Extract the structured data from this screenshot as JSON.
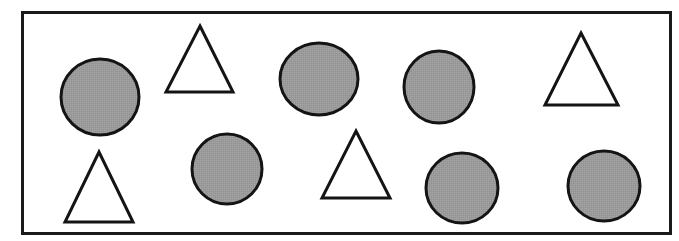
{
  "figure": {
    "canvas": {
      "width": 679,
      "height": 241
    },
    "background_color": "#ffffff",
    "frame": {
      "x": 21,
      "y": 11,
      "width": 651,
      "height": 224,
      "stroke_color": "#1a1a1a",
      "stroke_width": 3,
      "fill_color": "#ffffff"
    },
    "style": {
      "circle_fill": "#9a9a9a",
      "circle_stroke": "#141414",
      "circle_stroke_width": 3,
      "triangle_fill": "#ffffff",
      "triangle_stroke": "#141414",
      "triangle_stroke_width": 3
    },
    "counts": {
      "circles": 6,
      "triangles": 4,
      "total_shapes": 10,
      "rows": 2,
      "shapes_per_row": 5
    },
    "shapes": [
      {
        "id": "circle-1",
        "type": "circle",
        "row": 1,
        "column": 1,
        "fill": "gray",
        "cx": 100,
        "cy": 97,
        "rx": 39,
        "ry": 38
      },
      {
        "id": "triangle-1",
        "type": "triangle",
        "row": 1,
        "column": 2,
        "fill": "white",
        "apex_x": 200,
        "apex_y": 26,
        "base_left_x": 166,
        "base_right_x": 233,
        "base_y": 92
      },
      {
        "id": "circle-2",
        "type": "circle",
        "row": 1,
        "column": 3,
        "fill": "gray",
        "cx": 319,
        "cy": 79,
        "rx": 39,
        "ry": 36
      },
      {
        "id": "circle-3",
        "type": "circle",
        "row": 1,
        "column": 4,
        "fill": "gray",
        "cx": 439,
        "cy": 87,
        "rx": 35,
        "ry": 36
      },
      {
        "id": "triangle-2",
        "type": "triangle",
        "row": 1,
        "column": 5,
        "fill": "white",
        "apex_x": 581,
        "apex_y": 33,
        "base_left_x": 545,
        "base_right_x": 618,
        "base_y": 105
      },
      {
        "id": "triangle-3",
        "type": "triangle",
        "row": 2,
        "column": 1,
        "fill": "white",
        "apex_x": 99,
        "apex_y": 152,
        "base_left_x": 65,
        "base_right_x": 133,
        "base_y": 222
      },
      {
        "id": "circle-4",
        "type": "circle",
        "row": 2,
        "column": 2,
        "fill": "gray",
        "cx": 227,
        "cy": 169,
        "rx": 35,
        "ry": 35
      },
      {
        "id": "triangle-4",
        "type": "triangle",
        "row": 2,
        "column": 3,
        "fill": "white",
        "apex_x": 356,
        "apex_y": 131,
        "base_left_x": 322,
        "base_right_x": 390,
        "base_y": 198
      },
      {
        "id": "circle-5",
        "type": "circle",
        "row": 2,
        "column": 4,
        "fill": "gray",
        "cx": 462,
        "cy": 188,
        "rx": 36,
        "ry": 35
      },
      {
        "id": "circle-6",
        "type": "circle",
        "row": 2,
        "column": 5,
        "fill": "gray",
        "cx": 604,
        "cy": 186,
        "rx": 36,
        "ry": 35
      }
    ]
  }
}
